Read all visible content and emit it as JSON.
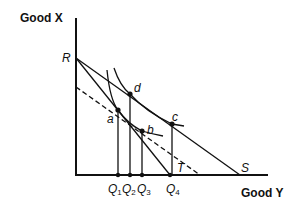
{
  "diagram": {
    "axes": {
      "y_title": "Good X",
      "x_title": "Good Y"
    },
    "intercepts": {
      "R": "R",
      "S": "S",
      "T": "T"
    },
    "points": {
      "a": "a",
      "b": "b",
      "c": "c",
      "d": "d"
    },
    "quantities": [
      {
        "base": "Q",
        "sub": "1"
      },
      {
        "base": "Q",
        "sub": "2"
      },
      {
        "base": "Q",
        "sub": "3"
      },
      {
        "base": "Q",
        "sub": "4"
      }
    ],
    "colors": {
      "line": "#111111",
      "background": "#ffffff"
    }
  }
}
